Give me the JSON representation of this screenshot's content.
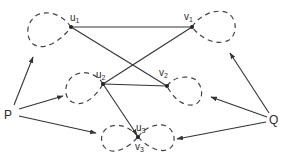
{
  "diagram": {
    "type": "graph",
    "stroke_color": "#333333",
    "background": "#ffffff",
    "terminals": [
      {
        "id": "P",
        "label": "P"
      },
      {
        "id": "Q",
        "label": "Q"
      }
    ],
    "vertices": [
      {
        "id": "u1",
        "label": "u",
        "sub": "1"
      },
      {
        "id": "v1",
        "label": "v",
        "sub": "1"
      },
      {
        "id": "u2",
        "label": "u",
        "sub": "2"
      },
      {
        "id": "v2",
        "label": "v",
        "sub": "2"
      },
      {
        "id": "u3",
        "label": "u",
        "sub": "3"
      },
      {
        "id": "v3",
        "label": "v",
        "sub": "3"
      }
    ],
    "edges": [
      {
        "from": "u1",
        "to": "v1",
        "style": "solid"
      },
      {
        "from": "u1",
        "to": "v2",
        "style": "solid"
      },
      {
        "from": "u2",
        "to": "v1",
        "style": "solid"
      },
      {
        "from": "u2",
        "to": "v2",
        "style": "solid"
      },
      {
        "from": "u2",
        "to": "u3",
        "style": "arrow"
      }
    ],
    "loops": [
      {
        "at": "u1",
        "side": "left",
        "style": "dashed"
      },
      {
        "at": "v1",
        "side": "right",
        "style": "dashed"
      },
      {
        "at": "u2",
        "side": "left",
        "style": "dashed"
      },
      {
        "at": "v2",
        "side": "right",
        "style": "dashed"
      },
      {
        "at": "u3",
        "side": "left",
        "style": "dashed"
      },
      {
        "at": "v3",
        "side": "right",
        "style": "dashed"
      }
    ],
    "arrows_from_terminals": [
      {
        "from": "P",
        "to": "u1-loop"
      },
      {
        "from": "P",
        "to": "u2-loop"
      },
      {
        "from": "P",
        "to": "u3-loop"
      },
      {
        "from": "Q",
        "to": "v1-loop"
      },
      {
        "from": "Q",
        "to": "v2-loop"
      },
      {
        "from": "Q",
        "to": "v3-loop"
      }
    ]
  }
}
